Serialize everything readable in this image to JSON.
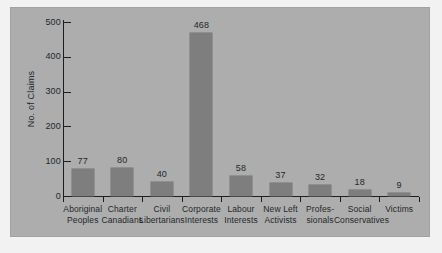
{
  "chart_data": {
    "type": "bar",
    "title": "",
    "xlabel": "",
    "ylabel": "No. of Claims",
    "ylim": [
      0,
      500
    ],
    "yticks": [
      "0",
      "100",
      "200",
      "300",
      "400",
      "500"
    ],
    "grid": false,
    "legend": null,
    "categories": [
      "Aboriginal Peoples",
      "Charter Canadians",
      "Civil Libertarians",
      "Corporate Interests",
      "Labour Interests",
      "New Left Activists",
      "Professionals",
      "Social Conservatives",
      "Victims"
    ],
    "category_lines": [
      [
        "Aboriginal",
        "Peoples"
      ],
      [
        "Charter",
        "Canadians"
      ],
      [
        "Civil",
        "Libertarians"
      ],
      [
        "Corporate",
        "Interests"
      ],
      [
        "Labour",
        "Interests"
      ],
      [
        "New Left",
        "Activists"
      ],
      [
        "Profes-",
        "sionals"
      ],
      [
        "Social",
        "Conservatives"
      ],
      [
        "Victims",
        ""
      ]
    ],
    "values": [
      77,
      80,
      40,
      468,
      58,
      37,
      32,
      18,
      9
    ],
    "value_labels": [
      "77",
      "80",
      "40",
      "468",
      "58",
      "37",
      "32",
      "18",
      "9"
    ],
    "colors": {
      "bar": "#7e7e7e",
      "plot_background": "#adadad",
      "figure_background": "#f2f2f2",
      "axis": "#1d1d1d",
      "text": "#23282b"
    }
  }
}
